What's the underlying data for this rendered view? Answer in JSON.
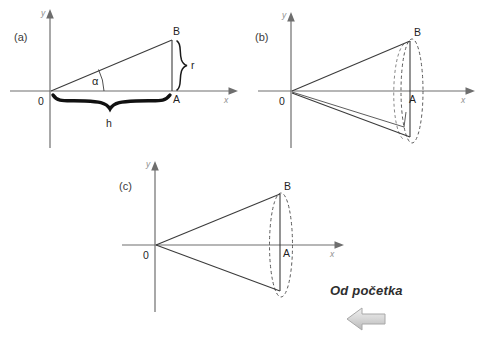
{
  "figure": {
    "panels": [
      {
        "id": "a",
        "label": "(a)",
        "axis_y_label": "y",
        "axis_x_label": "x",
        "origin_label": "0",
        "point_top_label": "B",
        "point_base_label": "A",
        "angle_label": "α",
        "height_label": "h",
        "radius_label": "r",
        "description": "right triangle with angle alpha at origin, height h along x-axis, radius r vertical"
      },
      {
        "id": "b",
        "label": "(b)",
        "axis_y_label": "y",
        "axis_x_label": "x",
        "origin_label": "0",
        "point_top_label": "B",
        "point_base_label": "A",
        "description": "triangle partially rotated about x-axis forming a cone, dashed ellipse base"
      },
      {
        "id": "c",
        "label": "(c)",
        "axis_y_label": "y",
        "axis_x_label": "x",
        "origin_label": "0",
        "point_top_label": "B",
        "point_base_label": "A",
        "description": "completed cone of revolution with dashed elliptical base"
      }
    ],
    "annotation": {
      "text": "Od početka",
      "arrow_icon": "arrow-left-icon",
      "arrow_direction": "left"
    },
    "colors": {
      "background": "#ffffff",
      "axis": "#6e6e6e",
      "stroke": "#3b3b3b",
      "dashed": "#5a5a5a",
      "brace": "#111111",
      "annotation_text": "#2e2e2e",
      "arrow_fill": "#d4d4d4",
      "arrow_stroke": "#a8a8a8"
    }
  }
}
